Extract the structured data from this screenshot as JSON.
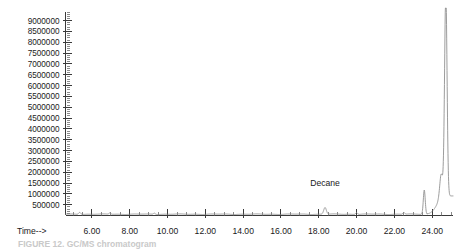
{
  "figure": {
    "caption": "FIGURE 12. GC/MS chromatogram",
    "annotation_label": "Decane"
  },
  "axes": {
    "x_title": "Time-->"
  },
  "chart_data": {
    "type": "line",
    "title": "",
    "subtitle": "",
    "xlabel": "Time-->",
    "ylabel": "Abundance",
    "xlim": [
      4.6,
      25.1
    ],
    "ylim": [
      0,
      9400000
    ],
    "grid": false,
    "legend": null,
    "x_ticks": [
      6.0,
      8.0,
      10.0,
      12.0,
      14.0,
      16.0,
      18.0,
      20.0,
      22.0,
      24.0
    ],
    "x_tick_labels": [
      "6.00",
      "8.00",
      "10.00",
      "12.00",
      "14.00",
      "16.00",
      "18.00",
      "20.00",
      "22.00",
      "24.00"
    ],
    "x_minor_tick_step": 0.5,
    "y_ticks": [
      500000,
      1000000,
      1500000,
      2000000,
      2500000,
      3000000,
      3500000,
      4000000,
      4500000,
      5000000,
      5500000,
      6000000,
      6500000,
      7000000,
      7500000,
      8000000,
      8500000,
      9000000
    ],
    "y_tick_labels": [
      "500000",
      "1000000",
      "1500000",
      "2000000",
      "2500000",
      "3000000",
      "3500000",
      "4000000",
      "4500000",
      "5000000",
      "5500000",
      "6000000",
      "6500000",
      "7000000",
      "7500000",
      "8000000",
      "8500000",
      "9000000"
    ],
    "y_minor_tick_step": 100000,
    "series": [
      {
        "name": "TIC",
        "baseline": 60000,
        "peaks": [
          {
            "label": "",
            "rt": 5.35,
            "height": 95000,
            "width": 0.055
          },
          {
            "label": "",
            "rt": 6.95,
            "height": 60000,
            "width": 0.05
          },
          {
            "label": "",
            "rt": 9.3,
            "height": 55000,
            "width": 0.05
          },
          {
            "label": "Decane",
            "rt": 18.33,
            "height": 310000,
            "width": 0.07
          },
          {
            "label": "",
            "rt": 20.0,
            "height": 85000,
            "width": 0.05
          },
          {
            "label": "",
            "rt": 22.5,
            "height": 80000,
            "width": 0.05
          },
          {
            "label": "",
            "rt": 23.58,
            "height": 1120000,
            "width": 0.05
          },
          {
            "label": "",
            "rt": 24.48,
            "height": 1000000,
            "width": 0.08
          },
          {
            "label": "",
            "rt": 24.72,
            "height": 9400000,
            "width": 0.065
          }
        ],
        "rise_region": {
          "start_rt": 23.75,
          "end_rt": 24.45,
          "start_value": 90000,
          "end_value": 900000
        }
      }
    ],
    "annotations": [
      {
        "text": "Decane",
        "rt": 18.33,
        "value": 1370000
      }
    ]
  }
}
